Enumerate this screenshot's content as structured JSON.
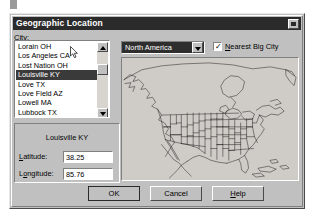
{
  "window": {
    "title": "Geographic Location",
    "close_icon": "close-icon"
  },
  "city_section": {
    "label": "City:",
    "items": [
      {
        "label": "Lorain OH",
        "selected": false
      },
      {
        "label": "Los Angeles CA",
        "selected": false
      },
      {
        "label": "Lost Nation OH",
        "selected": false
      },
      {
        "label": "Louisville KY",
        "selected": true
      },
      {
        "label": "Love  TX",
        "selected": false
      },
      {
        "label": "Love Field  AZ",
        "selected": false
      },
      {
        "label": "Lowell MA",
        "selected": false
      },
      {
        "label": "Lubbock TX",
        "selected": false
      },
      {
        "label": "Lucin  UT",
        "selected": false
      }
    ],
    "scrollbar": {
      "up_icon": "scroll-up-arrow-icon",
      "down_icon": "scroll-down-arrow-icon",
      "thumb_icon": "scrollbar-thumb"
    }
  },
  "coordinates": {
    "city_name": "Louisville KY",
    "latitude_label": "Latitude:",
    "latitude_value": "38.25",
    "longitude_label": "Longitude:",
    "longitude_value": "85.76"
  },
  "region": {
    "selected": "North America",
    "dropdown_icon": "chevron-down-icon",
    "options": [
      "North America"
    ]
  },
  "nearest_big_city": {
    "label": "Nearest Big City",
    "checked": true,
    "check_glyph": "✓"
  },
  "map": {
    "name": "north-america-map",
    "region": "North America"
  },
  "buttons": {
    "ok": "OK",
    "cancel": "Cancel",
    "help": "Help"
  },
  "cursor": {
    "name": "mouse-pointer",
    "x": 70,
    "y": 46
  }
}
